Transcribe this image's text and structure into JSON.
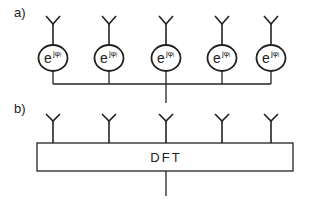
{
  "colors": {
    "stroke": "#222222",
    "background": "#ffffff"
  },
  "panel_a": {
    "label": "a)",
    "phase_shifter_base": "e",
    "phase_shifter_exponent": "jφᵢ",
    "antenna_count": 5,
    "antennas_x": [
      53,
      109,
      166,
      222,
      271
    ],
    "element_type": "phase-shifter"
  },
  "panel_b": {
    "label": "b)",
    "block_label": "DFT",
    "antenna_count": 5,
    "antennas_x": [
      53,
      109,
      166,
      222,
      271
    ]
  }
}
